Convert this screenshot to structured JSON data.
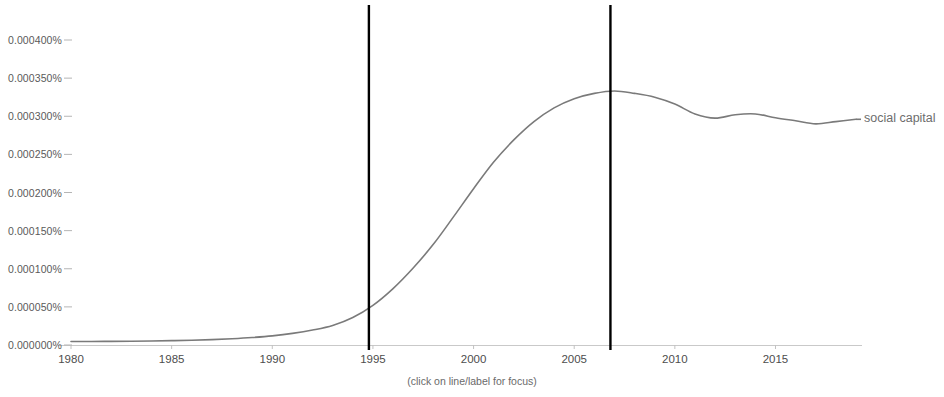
{
  "chart_data": {
    "type": "line",
    "title": "",
    "subtitle": "",
    "xlabel": "",
    "ylabel": "",
    "caption": "(click on line/label for focus)",
    "grid": false,
    "legend_position": "right-inline",
    "xlim": [
      1980,
      2019
    ],
    "ylim": [
      0.0,
      0.00045
    ],
    "x_ticks": [
      1980,
      1985,
      1990,
      1995,
      2000,
      2005,
      2010,
      2015
    ],
    "x_tick_labels": [
      "1980",
      "1985",
      "1990",
      "1995",
      "2000",
      "2005",
      "2010",
      "2015"
    ],
    "y_ticks": [
      0.0,
      5e-05,
      0.0001,
      0.00015,
      0.0002,
      0.00025,
      0.0003,
      0.00035,
      0.0004
    ],
    "y_tick_labels": [
      "0.000000%",
      "0.000050%",
      "0.000100%",
      "0.000150%",
      "0.000200%",
      "0.000250%",
      "0.000300%",
      "0.000350%",
      "0.000400%"
    ],
    "series": [
      {
        "name": "social capital",
        "color": "#7a7a7a",
        "x": [
          1980,
          1981,
          1982,
          1983,
          1984,
          1985,
          1986,
          1987,
          1988,
          1989,
          1990,
          1991,
          1992,
          1993,
          1994,
          1995,
          1996,
          1997,
          1998,
          1999,
          2000,
          2001,
          2002,
          2003,
          2004,
          2005,
          2006,
          2007,
          2008,
          2009,
          2010,
          2011,
          2012,
          2013,
          2014,
          2015,
          2016,
          2017,
          2018,
          2019
        ],
        "values": [
          4.5e-06,
          4.6e-06,
          4.8e-06,
          5e-06,
          5.3e-06,
          5.7e-06,
          6.2e-06,
          7e-06,
          8.2e-06,
          9.8e-06,
          1.2e-05,
          1.52e-05,
          1.96e-05,
          2.56e-05,
          3.6e-05,
          5.2e-05,
          7.4e-05,
          0.000101,
          0.000132,
          0.000168,
          0.000205,
          0.00024,
          0.000269,
          0.000293,
          0.000311,
          0.000323,
          0.00033,
          0.0003332,
          0.00033,
          0.000325,
          0.000316,
          0.000303,
          0.0002975,
          0.000302,
          0.000303,
          0.000298,
          0.000294,
          0.00029,
          0.000293,
          0.000296
        ]
      }
    ],
    "markers": [
      {
        "name": "marker-line-1",
        "x": 1994.8,
        "color": "#000000"
      },
      {
        "name": "marker-line-2",
        "x": 2006.8,
        "color": "#000000"
      }
    ]
  },
  "legend": {
    "entries": [
      {
        "label": "social capital"
      }
    ]
  },
  "footer": {
    "caption": "(click on line/label for focus)"
  }
}
